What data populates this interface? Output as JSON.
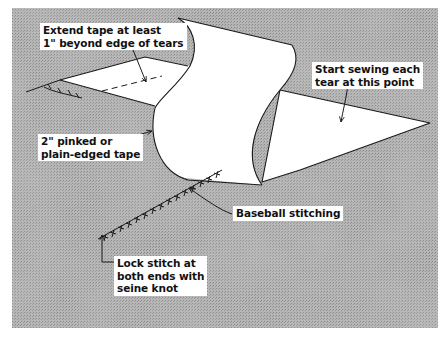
{
  "figure": {
    "background_color": "#9a9a9a",
    "tape_color": "#ffffff",
    "line_color": "#1a1a1a"
  },
  "labels": {
    "extend_tape": [
      "Extend tape at least",
      "1\" beyond edge of tears"
    ],
    "start_sewing": [
      "Start sewing each",
      "tear at this point"
    ],
    "tape_type": [
      "2\" pinked or",
      "plain-edged tape"
    ],
    "baseball_stitching": [
      "Baseball stitching"
    ],
    "lock_stitch": [
      "Lock stitch at",
      "both ends with",
      "seine knot"
    ]
  }
}
